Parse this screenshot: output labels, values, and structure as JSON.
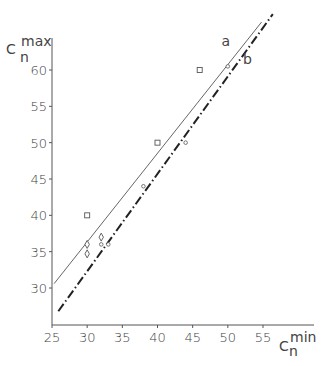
{
  "chart_data": {
    "type": "scatter",
    "title": "",
    "xlabel": "C_n^min",
    "ylabel": "C_n^max",
    "xlabel_main": "C",
    "xlabel_sup": "min",
    "xlabel_sub": "n",
    "ylabel_main": "C",
    "ylabel_sup": "max",
    "ylabel_sub": "n",
    "xlim": [
      25,
      58
    ],
    "ylim": [
      25,
      68
    ],
    "x_ticks": [
      "25",
      "30",
      "35",
      "40",
      "45",
      "50",
      "55"
    ],
    "y_ticks": [
      "30",
      "35",
      "40",
      "45",
      "50",
      "55",
      "60"
    ],
    "grid": false,
    "series": [
      {
        "name": "squares",
        "marker": "square",
        "points": [
          [
            30,
            40
          ],
          [
            40,
            50
          ],
          [
            46,
            60
          ]
        ]
      },
      {
        "name": "circles",
        "marker": "circle",
        "points": [
          [
            32,
            36
          ],
          [
            33,
            36
          ],
          [
            38,
            44
          ],
          [
            44,
            50
          ],
          [
            50,
            60.5
          ]
        ]
      },
      {
        "name": "diamonds",
        "marker": "diamond",
        "points": [
          [
            30,
            36
          ],
          [
            30,
            34.7
          ],
          [
            32,
            37
          ]
        ]
      }
    ],
    "lines": [
      {
        "name": "a",
        "style": "solid",
        "from": [
          25.3,
          30.6
        ],
        "to": [
          54.8,
          66.6
        ]
      },
      {
        "name": "b",
        "style": "dash-dot",
        "from": [
          25.9,
          26.8
        ],
        "to": [
          56.4,
          67.7
        ]
      }
    ],
    "line_labels": [
      {
        "text": "a",
        "at": [
          49.7,
          63.3
        ]
      },
      {
        "text": "b",
        "at": [
          52.8,
          60.8
        ]
      }
    ]
  }
}
